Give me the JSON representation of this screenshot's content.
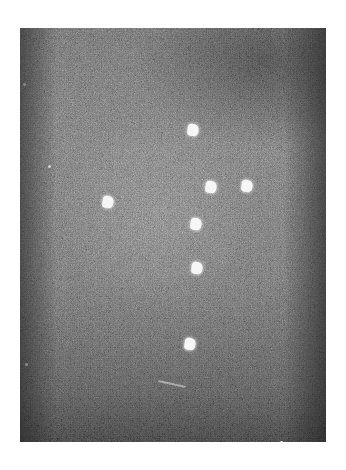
{
  "image": {
    "description": "Grainy monochrome photograph of bright spots against a dark night-sky-like background",
    "frame": {
      "x": 20,
      "y": 28,
      "width": 306,
      "height": 414
    },
    "background_color": "#ffffff",
    "spot_color": "#f6f6f6",
    "spots": [
      {
        "x": 173,
        "y": 102
      },
      {
        "x": 191,
        "y": 159
      },
      {
        "x": 227,
        "y": 158
      },
      {
        "x": 88,
        "y": 174
      },
      {
        "x": 176,
        "y": 196
      },
      {
        "x": 177,
        "y": 240
      },
      {
        "x": 170,
        "y": 316
      }
    ],
    "specks": [
      {
        "x": 3,
        "y": 55
      },
      {
        "x": 28,
        "y": 137
      },
      {
        "x": 5,
        "y": 335
      },
      {
        "x": 260,
        "y": 413
      }
    ],
    "scratches": [
      {
        "x": 138,
        "y": 355,
        "width": 28,
        "angle": 12
      }
    ]
  }
}
